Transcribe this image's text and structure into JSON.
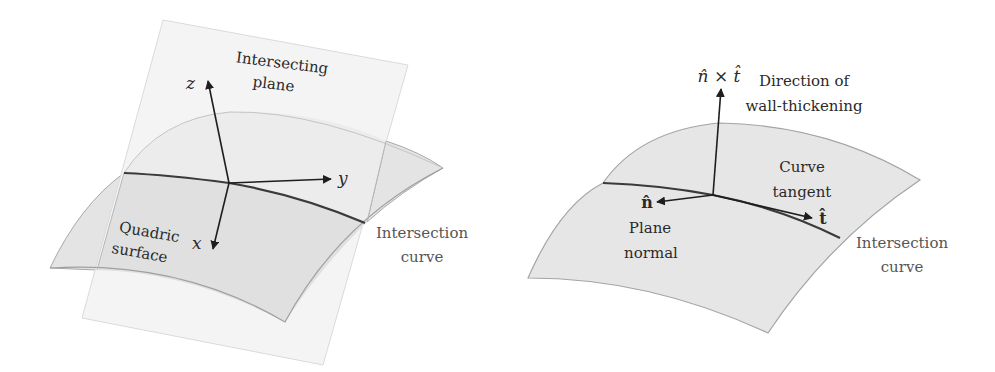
{
  "figure": {
    "left_panel": {
      "plane_label": [
        "Intersecting",
        "plane"
      ],
      "surface_label": [
        "Quadric",
        "surface"
      ],
      "curve_label": [
        "Intersection",
        "curve"
      ],
      "axes": {
        "z": "z",
        "y": "y",
        "x": "x"
      }
    },
    "right_panel": {
      "normal_cross_label": "n̂ × t̂",
      "thickening_label": [
        "Direction of",
        "wall-thickening"
      ],
      "tangent_label": [
        "Curve",
        "tangent"
      ],
      "tangent_symbol": "t̂",
      "normal_symbol": "n̂",
      "normal_label": [
        "Plane",
        "normal"
      ],
      "curve_label": [
        "Intersection",
        "curve"
      ]
    },
    "colors": {
      "plane_fill": "#f4f4f4",
      "plane_stroke": "#d8d8d8",
      "surface_fill": "#e2e2e2",
      "surface_fill_upper": "#ebebeb",
      "surface_stroke": "#a8a8a8",
      "curve_stroke": "#3a3a3a",
      "arrow": "#1e1e1e"
    }
  }
}
